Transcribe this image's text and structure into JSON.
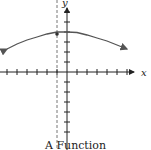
{
  "chart_data": {
    "type": "line",
    "title": "A Function",
    "xlabel": "x",
    "ylabel": "y",
    "grid": false,
    "xlim": [
      -6,
      6
    ],
    "ylim": [
      -6,
      6
    ],
    "x_ticks": [
      -6,
      -5,
      -4,
      -3,
      -2,
      -1,
      1,
      2,
      3,
      4,
      5,
      6
    ],
    "y_ticks": [
      -6,
      -5,
      -4,
      -3,
      -2,
      -1,
      1,
      2,
      3,
      4,
      5,
      6
    ],
    "series": [
      {
        "name": "curve",
        "style": "solid",
        "both_ends_arrows": true,
        "x": [
          -6,
          -5,
          -4,
          -3,
          -2,
          -1,
          0,
          1,
          2,
          3,
          4,
          5,
          6
        ],
        "y": [
          2.3,
          2.8,
          3.2,
          3.5,
          3.8,
          4.0,
          4.0,
          3.95,
          3.7,
          3.4,
          3.1,
          2.7,
          2.3
        ]
      }
    ],
    "annotations": [
      {
        "type": "vertical-dashed-line",
        "x": -1,
        "label": ""
      },
      {
        "type": "point",
        "x": -1,
        "y": 4
      }
    ],
    "colors": {
      "axis": "#222222",
      "curve": "#555555",
      "dashed": "#777777"
    }
  },
  "caption": "A Function"
}
